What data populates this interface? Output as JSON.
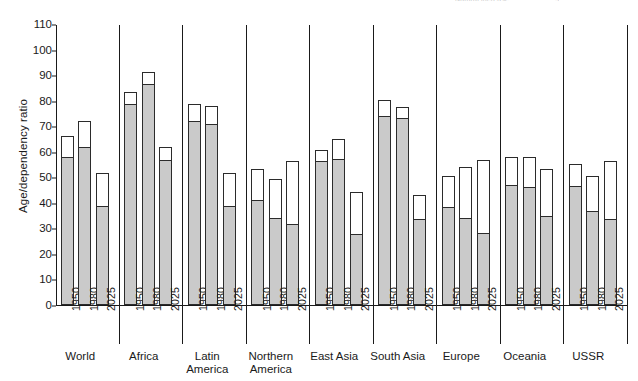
{
  "page": {
    "cut_header_text": "Natural increase",
    "cut_header_page": "9"
  },
  "chart_data": {
    "type": "bar",
    "title": "",
    "xlabel": "",
    "ylabel": "Age/dependency ratio",
    "ylim": [
      0,
      110
    ],
    "yticks": [
      0,
      10,
      20,
      30,
      40,
      50,
      60,
      70,
      80,
      90,
      100,
      110
    ],
    "grid": false,
    "legend_position": "none",
    "stacked": true,
    "categories": [
      "1950",
      "1980",
      "2025"
    ],
    "series": [
      {
        "name": "youth (shaded)",
        "color": "#cacaca"
      },
      {
        "name": "total (outline top)",
        "color": "#ffffff"
      }
    ],
    "groups": [
      {
        "label": "World",
        "bars": [
          {
            "year": "1950",
            "total": 66.5,
            "shaded": 57.8
          },
          {
            "year": "1980",
            "total": 72.3,
            "shaded": 61.7
          },
          {
            "year": "2025",
            "total": 51.8,
            "shaded": 38.5
          }
        ]
      },
      {
        "label": "Africa",
        "bars": [
          {
            "year": "1950",
            "total": 83.8,
            "shaded": 78.5
          },
          {
            "year": "1980",
            "total": 91.7,
            "shaded": 86.4
          },
          {
            "year": "2025",
            "total": 62.2,
            "shaded": 56.8
          }
        ]
      },
      {
        "label": "Latin\nAmerica",
        "bars": [
          {
            "year": "1950",
            "total": 79.1,
            "shaded": 72.1
          },
          {
            "year": "1980",
            "total": 78.3,
            "shaded": 70.6
          },
          {
            "year": "2025",
            "total": 51.9,
            "shaded": 38.6
          }
        ]
      },
      {
        "label": "Northern\nAmerica",
        "bars": [
          {
            "year": "1950",
            "total": 53.6,
            "shaded": 41.0
          },
          {
            "year": "1980",
            "total": 49.6,
            "shaded": 34.1
          },
          {
            "year": "2025",
            "total": 56.6,
            "shaded": 31.5
          }
        ]
      },
      {
        "label": "East Asia",
        "bars": [
          {
            "year": "1950",
            "total": 61.1,
            "shaded": 56.4
          },
          {
            "year": "1980",
            "total": 65.4,
            "shaded": 57.2
          },
          {
            "year": "2025",
            "total": 44.4,
            "shaded": 27.8
          }
        ]
      },
      {
        "label": "South Asia",
        "bars": [
          {
            "year": "1950",
            "total": 80.6,
            "shaded": 74.1
          },
          {
            "year": "1980",
            "total": 77.9,
            "shaded": 73.2
          },
          {
            "year": "2025",
            "total": 43.5,
            "shaded": 33.4
          }
        ]
      },
      {
        "label": "Europe",
        "bars": [
          {
            "year": "1950",
            "total": 50.9,
            "shaded": 38.1
          },
          {
            "year": "1980",
            "total": 54.4,
            "shaded": 33.8
          },
          {
            "year": "2025",
            "total": 57.2,
            "shaded": 28.0
          }
        ]
      },
      {
        "label": "Oceania",
        "bars": [
          {
            "year": "1950",
            "total": 58.1,
            "shaded": 47.0
          },
          {
            "year": "1980",
            "total": 58.2,
            "shaded": 46.0
          },
          {
            "year": "2025",
            "total": 53.6,
            "shaded": 34.6
          }
        ]
      },
      {
        "label": "USSR",
        "bars": [
          {
            "year": "1950",
            "total": 55.5,
            "shaded": 46.4
          },
          {
            "year": "1980",
            "total": 50.9,
            "shaded": 36.6
          },
          {
            "year": "2025",
            "total": 56.6,
            "shaded": 33.5
          }
        ]
      }
    ]
  }
}
